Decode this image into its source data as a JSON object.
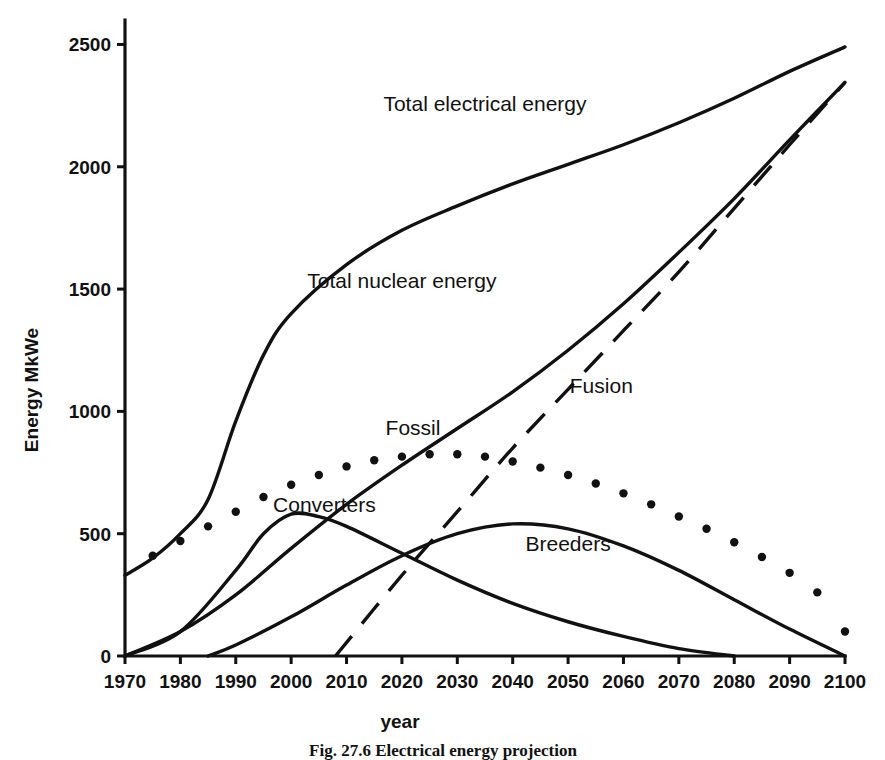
{
  "figure": {
    "caption": "Fig. 27.6    Electrical energy projection",
    "xlabel": "year",
    "ylabel": "Energy MkWe"
  },
  "chart_data": {
    "type": "line",
    "title": "",
    "xlabel": "year",
    "ylabel": "Energy MkWe",
    "xlim": [
      1970,
      2100
    ],
    "ylim": [
      0,
      2600
    ],
    "xticks": [
      1970,
      1980,
      1990,
      2000,
      2010,
      2020,
      2030,
      2040,
      2050,
      2060,
      2070,
      2080,
      2090,
      2100
    ],
    "yticks": [
      0,
      500,
      1000,
      1500,
      2000,
      2500
    ],
    "grid": false,
    "legend": "inline-annotations",
    "series": [
      {
        "name": "Total electrical energy",
        "style": "solid",
        "label_x": 2035,
        "label_y": 2230,
        "x": [
          1970,
          1975,
          1980,
          1985,
          1990,
          1995,
          2000,
          2010,
          2020,
          2030,
          2040,
          2050,
          2060,
          2070,
          2080,
          2090,
          2100
        ],
        "y": [
          330,
          400,
          500,
          640,
          960,
          1230,
          1400,
          1600,
          1740,
          1840,
          1930,
          2010,
          2090,
          2180,
          2280,
          2390,
          2490
        ]
      },
      {
        "name": "Total nuclear energy",
        "style": "solid",
        "label_x": 2020,
        "label_y": 1505,
        "x": [
          1970,
          1980,
          1990,
          2000,
          2010,
          2020,
          2030,
          2040,
          2050,
          2060,
          2070,
          2080,
          2090,
          2100
        ],
        "y": [
          0,
          100,
          250,
          440,
          620,
          780,
          930,
          1080,
          1250,
          1440,
          1650,
          1870,
          2110,
          2345
        ]
      },
      {
        "name": "Fossil",
        "style": "dotted",
        "label_x": 2022,
        "label_y": 905,
        "x": [
          1975,
          1980,
          1985,
          1990,
          1995,
          2000,
          2005,
          2010,
          2015,
          2020,
          2025,
          2030,
          2035,
          2040,
          2045,
          2050,
          2055,
          2060,
          2065,
          2070,
          2075,
          2080,
          2085,
          2090,
          2095,
          2100
        ],
        "y": [
          410,
          470,
          530,
          590,
          650,
          700,
          740,
          775,
          800,
          815,
          825,
          825,
          815,
          795,
          770,
          740,
          705,
          665,
          620,
          570,
          520,
          465,
          405,
          340,
          260,
          100
        ]
      },
      {
        "name": "Converters",
        "style": "solid",
        "label_x": 2006,
        "label_y": 590,
        "x": [
          1970,
          1980,
          1990,
          1995,
          2000,
          2005,
          2010,
          2020,
          2030,
          2040,
          2050,
          2060,
          2070,
          2080
        ],
        "y": [
          0,
          100,
          350,
          500,
          580,
          570,
          530,
          420,
          310,
          215,
          140,
          80,
          30,
          0
        ]
      },
      {
        "name": "Breeders",
        "style": "solid",
        "label_x": 2050,
        "label_y": 430,
        "x": [
          1985,
          1990,
          2000,
          2010,
          2020,
          2030,
          2040,
          2050,
          2060,
          2070,
          2080,
          2090,
          2100
        ],
        "y": [
          0,
          45,
          160,
          290,
          410,
          500,
          540,
          520,
          450,
          350,
          230,
          110,
          0
        ]
      },
      {
        "name": "Fusion",
        "style": "dashed",
        "label_x": 2056,
        "label_y": 1075,
        "x": [
          2008,
          2020,
          2030,
          2040,
          2050,
          2060,
          2070,
          2080,
          2090,
          2100
        ],
        "y": [
          0,
          330,
          590,
          850,
          1090,
          1330,
          1570,
          1830,
          2090,
          2345
        ]
      }
    ]
  }
}
